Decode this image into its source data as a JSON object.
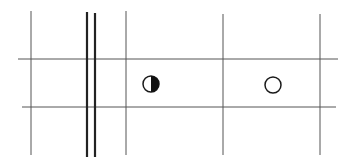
{
  "diagram": {
    "type": "grid-with-symbols",
    "background": "#ffffff",
    "line_color": "#555555",
    "heavy_line_color": "#222222",
    "horizontal_lines": [
      {
        "y": 59,
        "x1": 18,
        "x2": 338
      },
      {
        "y": 107,
        "x1": 22,
        "x2": 336
      }
    ],
    "vertical_lines": [
      {
        "x": 31,
        "y1": 11,
        "y2": 155,
        "weight": "thin"
      },
      {
        "x": 87,
        "y1": 12,
        "y2": 157,
        "weight": "heavy"
      },
      {
        "x": 95,
        "y1": 13,
        "y2": 157,
        "weight": "heavy"
      },
      {
        "x": 126,
        "y1": 11,
        "y2": 155,
        "weight": "thin"
      },
      {
        "x": 223,
        "y1": 14,
        "y2": 155,
        "weight": "thin"
      },
      {
        "x": 320,
        "y1": 14,
        "y2": 155,
        "weight": "thin"
      }
    ],
    "symbols": [
      {
        "name": "half-filled-circle",
        "cx": 151,
        "cy": 84,
        "r": 8,
        "fill": "right-half-black"
      },
      {
        "name": "open-circle",
        "cx": 273,
        "cy": 85,
        "r": 8,
        "fill": "none"
      }
    ]
  }
}
